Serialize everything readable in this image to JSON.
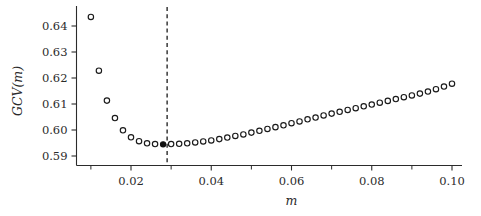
{
  "chart_data": {
    "type": "scatter",
    "title": "",
    "subtitle": "",
    "xlabel": "m",
    "ylabel": "GCV(m)",
    "xlim": [
      0.008,
      0.1035
    ],
    "ylim": [
      0.5865,
      0.6465
    ],
    "grid": false,
    "legend": null,
    "xticks": [
      0.02,
      0.04,
      0.06,
      0.08,
      0.1
    ],
    "xtick_labels": [
      "0.02",
      "0.04",
      "0.06",
      "0.08",
      "0.10"
    ],
    "xticks_minor": [
      0.01,
      0.03,
      0.05,
      0.07,
      0.09
    ],
    "yticks": [
      0.59,
      0.6,
      0.61,
      0.62,
      0.63,
      0.64
    ],
    "ytick_labels": [
      "0.59",
      "0.60",
      "0.61",
      "0.62",
      "0.63",
      "0.64"
    ],
    "marker_style": "open-circle",
    "marker_color": "#1a1a1a",
    "highlight_marker_style": "filled-circle",
    "highlight_color": "#111111",
    "annotations": [
      {
        "name": "minimum-vline",
        "type": "vertical-dashed-line",
        "x": 0.029,
        "label": ""
      }
    ],
    "x": [
      0.01,
      0.012,
      0.014,
      0.016,
      0.018,
      0.02,
      0.022,
      0.024,
      0.026,
      0.028,
      0.03,
      0.032,
      0.034,
      0.036,
      0.038,
      0.04,
      0.042,
      0.044,
      0.046,
      0.048,
      0.05,
      0.052,
      0.054,
      0.056,
      0.058,
      0.06,
      0.062,
      0.064,
      0.066,
      0.068,
      0.07,
      0.072,
      0.074,
      0.076,
      0.078,
      0.08,
      0.082,
      0.084,
      0.086,
      0.088,
      0.09,
      0.092,
      0.094,
      0.096,
      0.098,
      0.1
    ],
    "values": [
      0.6435,
      0.6228,
      0.6113,
      0.6046,
      0.5999,
      0.5972,
      0.5957,
      0.5949,
      0.5946,
      0.5945,
      0.5946,
      0.5947,
      0.5949,
      0.5952,
      0.5956,
      0.596,
      0.5965,
      0.5971,
      0.5977,
      0.5983,
      0.599,
      0.5997,
      0.6004,
      0.6011,
      0.6018,
      0.6026,
      0.6033,
      0.6041,
      0.6048,
      0.6056,
      0.6063,
      0.607,
      0.6077,
      0.6084,
      0.6091,
      0.6098,
      0.6105,
      0.6112,
      0.6119,
      0.6126,
      0.6133,
      0.614,
      0.6148,
      0.6157,
      0.6167,
      0.6178
    ],
    "highlight_index": 9,
    "highlight_point": {
      "x": 0.029,
      "y": 0.5945
    }
  }
}
